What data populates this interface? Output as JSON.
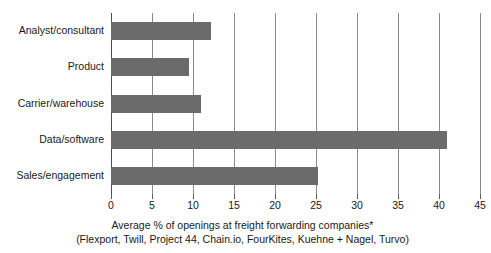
{
  "chart_data": {
    "type": "bar",
    "orientation": "horizontal",
    "title": "",
    "subtitle": "",
    "categories": [
      "Analyst/consultant",
      "Product",
      "Carrier/warehouse",
      "Data/software",
      "Sales/engagement"
    ],
    "values": [
      12.2,
      9.5,
      11.0,
      41.0,
      25.2
    ],
    "series": [
      {
        "name": "Average % of openings",
        "values": [
          12.2,
          9.5,
          11.0,
          41.0,
          25.2
        ]
      }
    ],
    "xlabel": "Average % of openings at freight forwarding companies*",
    "ylabel": "",
    "xlim": [
      0,
      45
    ],
    "xticks": [
      0,
      5,
      10,
      15,
      20,
      25,
      30,
      35,
      40,
      45
    ],
    "xtick_labels": [
      "0",
      "5",
      "10",
      "15",
      "20",
      "25",
      "30",
      "35",
      "40",
      "45"
    ],
    "grid": "vertical",
    "legend": "none",
    "bar_color": "#6b6b6b",
    "grid_color": "#8a8a8a",
    "background_color": "#ffffff",
    "caption_lines": [
      "Average % of openings at freight forwarding companies*",
      "(Flexport, Twill, Project 44, Chain.io, FourKites, Kuehne + Nagel, Turvo)"
    ],
    "companies": [
      "Flexport",
      "Twill",
      "Project 44",
      "Chain.io",
      "FourKites",
      "Kuehne + Nagel",
      "Turvo"
    ]
  }
}
